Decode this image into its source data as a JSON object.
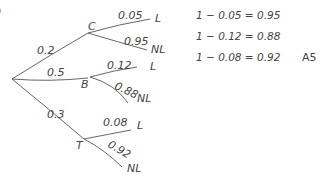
{
  "paren": ")",
  "tree": {
    "first_level": [
      {
        "node": "C",
        "prob": "0.2"
      },
      {
        "node": "B",
        "prob": "0.5"
      },
      {
        "node": "T",
        "prob": "0.3"
      }
    ],
    "branches": {
      "C": [
        {
          "outcome": "L",
          "prob": "0.05"
        },
        {
          "outcome": "NL",
          "prob": "0.95"
        }
      ],
      "B": [
        {
          "outcome": "L",
          "prob": "0.12"
        },
        {
          "outcome": "NL",
          "prob": "0.88"
        }
      ],
      "T": [
        {
          "outcome": "L",
          "prob": "0.08"
        },
        {
          "outcome": "NL",
          "prob": "0.92"
        }
      ]
    }
  },
  "equations": [
    "1 − 0.05 = 0.95",
    "1 − 0.12 = 0.88",
    "1 − 0.08 = 0.92"
  ],
  "reference": "A5"
}
